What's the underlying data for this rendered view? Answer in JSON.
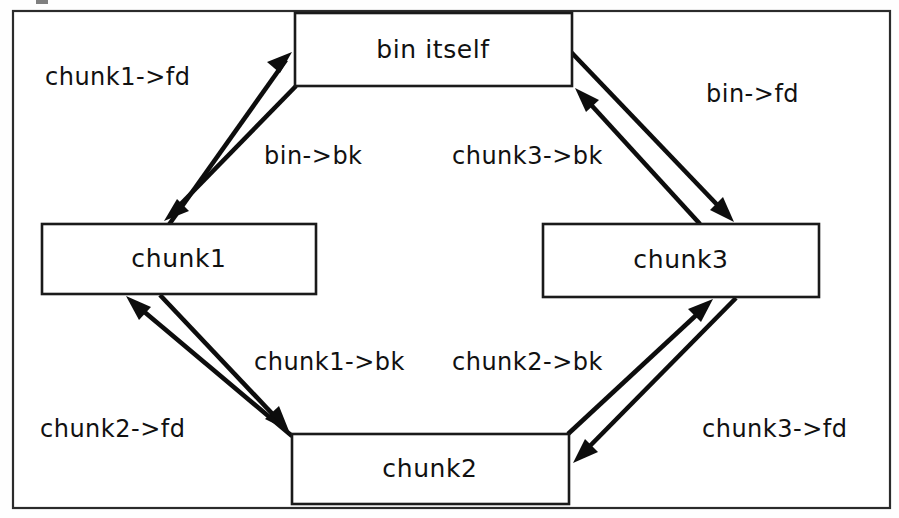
{
  "figure": {
    "background_color": "#ffffff",
    "line_color": "#0d0d0d",
    "text_color": "#111111",
    "frame_color": "#2b2b2b"
  },
  "nodes": [
    {
      "id": "bin",
      "label": "bin itself",
      "x": 295,
      "y": 13,
      "w": 277,
      "h": 73
    },
    {
      "id": "chunk1",
      "label": "chunk1",
      "x": 42,
      "y": 224,
      "w": 274,
      "h": 70
    },
    {
      "id": "chunk3",
      "label": "chunk3",
      "x": 543,
      "y": 224,
      "w": 276,
      "h": 73
    },
    {
      "id": "chunk2",
      "label": "chunk2",
      "x": 292,
      "y": 434,
      "w": 277,
      "h": 70
    }
  ],
  "edges": [
    {
      "id": "chunk1-fd",
      "label": "chunk1->fd",
      "from": "chunk1",
      "to": "bin",
      "label_x": 45,
      "label_y": 85,
      "anchor": "start",
      "x1": 168,
      "y1": 226,
      "x2": 292,
      "y2": 52
    },
    {
      "id": "bin-bk",
      "label": "bin->bk",
      "from": "bin",
      "to": "chunk1",
      "label_x": 264,
      "label_y": 164,
      "anchor": "start",
      "x1": 296,
      "y1": 86,
      "x2": 166,
      "y2": 220
    },
    {
      "id": "bin-fd",
      "label": "bin->fd",
      "from": "bin",
      "to": "chunk3",
      "label_x": 706,
      "label_y": 102,
      "anchor": "start",
      "x1": 571,
      "y1": 52,
      "x2": 733,
      "y2": 222
    },
    {
      "id": "chunk3-bk",
      "label": "chunk3->bk",
      "from": "chunk3",
      "to": "bin",
      "label_x": 452,
      "label_y": 164,
      "anchor": "start",
      "x1": 700,
      "y1": 224,
      "x2": 575,
      "y2": 88
    },
    {
      "id": "chunk1-bk",
      "label": "chunk1->bk",
      "from": "chunk1",
      "to": "chunk2",
      "label_x": 254,
      "label_y": 370,
      "anchor": "start",
      "x1": 160,
      "y1": 295,
      "x2": 289,
      "y2": 431
    },
    {
      "id": "chunk2-fd",
      "label": "chunk2->fd",
      "from": "chunk2",
      "to": "chunk1",
      "label_x": 40,
      "label_y": 437,
      "anchor": "start",
      "x1": 292,
      "y1": 436,
      "x2": 127,
      "y2": 296
    },
    {
      "id": "chunk2-bk",
      "label": "chunk2->bk",
      "from": "chunk2",
      "to": "chunk3",
      "label_x": 452,
      "label_y": 370,
      "anchor": "start",
      "x1": 568,
      "y1": 434,
      "x2": 697,
      "y2": 299
    },
    {
      "id": "chunk3-fd",
      "label": "chunk3->fd",
      "from": "chunk3",
      "to": "chunk2",
      "label_x": 702,
      "label_y": 437,
      "anchor": "start",
      "x1": 736,
      "y1": 298,
      "x2": 573,
      "y2": 463
    }
  ],
  "frame": {
    "x": 13,
    "y": 11,
    "w": 877,
    "h": 497
  }
}
